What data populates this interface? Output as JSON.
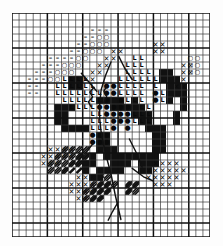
{
  "chart": {
    "type": "grid-pattern",
    "columns": 28,
    "rows": 32,
    "cell_px": 7,
    "heavy_line_every": 5,
    "grid_color": "#3a3a3a",
    "heavy_color": "#111111",
    "fill_color": "#111111",
    "symbol_color": "#0a0a0a",
    "background": "#ffffff"
  },
  "symbols": {
    "L": "L",
    "dot": "●",
    "circle": "○",
    "dash": "–",
    "cross": "✕"
  },
  "legend": {
    "items": [
      {
        "symbol": "L",
        "name": "light-thread"
      },
      {
        "symbol": "●",
        "name": "dot-thread"
      },
      {
        "symbol": "○",
        "name": "circle-thread"
      },
      {
        "symbol": "–",
        "name": "dash-thread"
      },
      {
        "symbol": "✕",
        "name": "cross-thread"
      },
      {
        "symbol": "■",
        "name": "solid-black-thread"
      },
      {
        "symbol": "╱",
        "name": "half-stitch-hatch"
      }
    ]
  },
  "cells": {
    "black": [
      [
        6,
        13
      ],
      [
        6,
        14
      ],
      [
        6,
        15
      ],
      [
        7,
        13
      ],
      [
        7,
        14
      ],
      [
        7,
        15
      ],
      [
        7,
        16
      ],
      [
        8,
        13
      ],
      [
        8,
        16
      ],
      [
        9,
        16
      ],
      [
        10,
        16
      ],
      [
        12,
        12
      ],
      [
        12,
        17
      ],
      [
        12,
        18
      ],
      [
        12,
        19
      ],
      [
        13,
        12
      ],
      [
        13,
        17
      ],
      [
        13,
        18
      ],
      [
        13,
        19
      ],
      [
        13,
        20
      ],
      [
        14,
        12
      ],
      [
        14,
        13
      ],
      [
        14,
        19
      ],
      [
        14,
        20
      ],
      [
        15,
        12
      ],
      [
        15,
        13
      ],
      [
        15,
        20
      ],
      [
        16,
        13
      ],
      [
        16,
        20
      ],
      [
        11,
        20
      ],
      [
        11,
        21
      ],
      [
        10,
        21
      ],
      [
        10,
        22
      ],
      [
        17,
        12
      ],
      [
        17,
        13
      ],
      [
        17,
        14
      ],
      [
        17,
        20
      ],
      [
        18,
        13
      ],
      [
        18,
        14
      ],
      [
        18,
        15
      ],
      [
        18,
        20
      ],
      [
        19,
        14
      ],
      [
        19,
        15
      ],
      [
        19,
        16
      ],
      [
        19,
        20
      ],
      [
        19,
        21
      ],
      [
        20,
        16
      ],
      [
        20,
        17
      ],
      [
        20,
        18
      ],
      [
        20,
        19
      ],
      [
        20,
        20
      ],
      [
        20,
        21
      ],
      [
        21,
        16
      ],
      [
        21,
        17
      ],
      [
        21,
        18
      ],
      [
        21,
        19
      ],
      [
        22,
        10
      ],
      [
        22,
        11
      ],
      [
        22,
        12
      ],
      [
        9,
        9
      ],
      [
        9,
        10
      ],
      [
        8,
        9
      ],
      [
        8,
        10
      ],
      [
        21,
        8
      ],
      [
        21,
        9
      ],
      [
        22,
        8
      ],
      [
        22,
        9
      ],
      [
        23,
        9
      ],
      [
        23,
        10
      ],
      [
        23,
        11
      ],
      [
        24,
        10
      ],
      [
        24,
        11
      ],
      [
        14,
        21
      ],
      [
        14,
        22
      ],
      [
        15,
        21
      ],
      [
        15,
        22
      ],
      [
        16,
        21
      ],
      [
        13,
        22
      ],
      [
        12,
        22
      ],
      [
        12,
        23
      ],
      [
        11,
        23
      ],
      [
        18,
        21
      ],
      [
        18,
        22
      ],
      [
        19,
        22
      ],
      [
        23,
        14
      ],
      [
        23,
        15
      ],
      [
        24,
        12
      ],
      [
        24,
        13
      ]
    ],
    "L": [
      [
        7,
        9
      ],
      [
        8,
        9
      ],
      [
        9,
        9
      ],
      [
        10,
        9
      ],
      [
        6,
        10
      ],
      [
        7,
        10
      ],
      [
        8,
        10
      ],
      [
        9,
        10
      ],
      [
        10,
        10
      ],
      [
        11,
        10
      ],
      [
        6,
        11
      ],
      [
        7,
        11
      ],
      [
        8,
        11
      ],
      [
        9,
        11
      ],
      [
        10,
        11
      ],
      [
        11,
        11
      ],
      [
        12,
        11
      ],
      [
        7,
        12
      ],
      [
        8,
        12
      ],
      [
        9,
        12
      ],
      [
        10,
        12
      ],
      [
        11,
        12
      ],
      [
        12,
        12
      ],
      [
        8,
        13
      ],
      [
        9,
        13
      ],
      [
        10,
        13
      ],
      [
        11,
        13
      ],
      [
        11,
        14
      ],
      [
        12,
        14
      ],
      [
        13,
        14
      ],
      [
        11,
        15
      ],
      [
        12,
        15
      ],
      [
        13,
        15
      ],
      [
        11,
        16
      ],
      [
        12,
        16
      ],
      [
        13,
        16
      ],
      [
        17,
        6
      ],
      [
        18,
        6
      ],
      [
        16,
        7
      ],
      [
        17,
        7
      ],
      [
        18,
        7
      ],
      [
        16,
        8
      ],
      [
        17,
        8
      ],
      [
        18,
        8
      ],
      [
        19,
        8
      ],
      [
        15,
        9
      ],
      [
        16,
        9
      ],
      [
        17,
        9
      ],
      [
        18,
        9
      ],
      [
        19,
        9
      ],
      [
        15,
        10
      ],
      [
        16,
        10
      ],
      [
        17,
        10
      ],
      [
        18,
        10
      ],
      [
        15,
        11
      ],
      [
        16,
        11
      ],
      [
        17,
        11
      ],
      [
        18,
        11
      ],
      [
        16,
        12
      ],
      [
        17,
        12
      ],
      [
        18,
        12
      ],
      [
        18,
        13
      ],
      [
        19,
        13
      ],
      [
        17,
        14
      ],
      [
        18,
        14
      ],
      [
        19,
        14
      ],
      [
        17,
        15
      ],
      [
        18,
        15
      ],
      [
        19,
        15
      ],
      [
        20,
        9
      ],
      [
        20,
        10
      ],
      [
        21,
        11
      ],
      [
        21,
        12
      ]
    ],
    "dot": [
      [
        13,
        10
      ],
      [
        13,
        11
      ],
      [
        13,
        12
      ],
      [
        13,
        13
      ],
      [
        12,
        13
      ],
      [
        11,
        17
      ],
      [
        12,
        17
      ],
      [
        13,
        17
      ],
      [
        11,
        18
      ],
      [
        12,
        18
      ],
      [
        13,
        18
      ],
      [
        14,
        10
      ],
      [
        14,
        11
      ],
      [
        15,
        12
      ],
      [
        15,
        13
      ],
      [
        14,
        13
      ],
      [
        14,
        14
      ],
      [
        13,
        14
      ],
      [
        16,
        13
      ],
      [
        16,
        14
      ],
      [
        15,
        14
      ],
      [
        15,
        15
      ],
      [
        16,
        15
      ],
      [
        16,
        16
      ],
      [
        14,
        15
      ],
      [
        14,
        16
      ],
      [
        20,
        11
      ],
      [
        20,
        12
      ]
    ],
    "circle": [
      [
        12,
        3
      ],
      [
        13,
        3
      ],
      [
        11,
        4
      ],
      [
        12,
        4
      ],
      [
        13,
        4
      ],
      [
        10,
        5
      ],
      [
        11,
        5
      ],
      [
        12,
        5
      ],
      [
        9,
        6
      ],
      [
        10,
        6
      ],
      [
        7,
        7
      ],
      [
        8,
        7
      ],
      [
        9,
        7
      ],
      [
        6,
        8
      ],
      [
        7,
        8
      ],
      [
        8,
        8
      ],
      [
        5,
        9
      ],
      [
        6,
        9
      ],
      [
        25,
        6
      ],
      [
        26,
        6
      ],
      [
        25,
        7
      ],
      [
        26,
        7
      ],
      [
        25,
        8
      ],
      [
        26,
        8
      ]
    ],
    "dash": [
      [
        11,
        2
      ],
      [
        12,
        2
      ],
      [
        13,
        2
      ],
      [
        10,
        3
      ],
      [
        11,
        3
      ],
      [
        9,
        4
      ],
      [
        10,
        4
      ],
      [
        8,
        5
      ],
      [
        9,
        5
      ],
      [
        5,
        6
      ],
      [
        6,
        6
      ],
      [
        7,
        6
      ],
      [
        8,
        6
      ],
      [
        4,
        7
      ],
      [
        5,
        7
      ],
      [
        6,
        7
      ],
      [
        3,
        8
      ],
      [
        4,
        8
      ],
      [
        5,
        8
      ],
      [
        2,
        9
      ],
      [
        3,
        9
      ],
      [
        4,
        9
      ],
      [
        2,
        10
      ],
      [
        3,
        10
      ],
      [
        2,
        11
      ],
      [
        3,
        11
      ]
    ],
    "cross": [
      [
        14,
        5
      ],
      [
        15,
        5
      ],
      [
        13,
        6
      ],
      [
        14,
        6
      ],
      [
        12,
        7
      ],
      [
        13,
        7
      ],
      [
        11,
        8
      ],
      [
        12,
        8
      ],
      [
        10,
        9
      ],
      [
        11,
        9
      ],
      [
        20,
        4
      ],
      [
        21,
        4
      ],
      [
        20,
        5
      ],
      [
        21,
        5
      ],
      [
        24,
        7
      ],
      [
        25,
        7
      ],
      [
        24,
        8
      ],
      [
        25,
        8
      ],
      [
        24,
        9
      ],
      [
        23,
        10
      ],
      [
        24,
        10
      ],
      [
        5,
        19
      ],
      [
        6,
        19
      ],
      [
        7,
        19
      ],
      [
        8,
        19
      ],
      [
        4,
        20
      ],
      [
        5,
        20
      ],
      [
        6,
        20
      ],
      [
        7,
        20
      ],
      [
        8,
        20
      ],
      [
        4,
        21
      ],
      [
        5,
        21
      ],
      [
        6,
        21
      ],
      [
        9,
        23
      ],
      [
        10,
        23
      ],
      [
        11,
        23
      ],
      [
        8,
        24
      ],
      [
        9,
        24
      ],
      [
        10,
        24
      ],
      [
        11,
        24
      ],
      [
        12,
        24
      ],
      [
        8,
        25
      ],
      [
        9,
        25
      ],
      [
        10,
        25
      ],
      [
        11,
        25
      ],
      [
        9,
        26
      ],
      [
        10,
        26
      ],
      [
        20,
        21
      ],
      [
        21,
        21
      ],
      [
        22,
        21
      ],
      [
        23,
        21
      ],
      [
        19,
        22
      ],
      [
        20,
        22
      ],
      [
        21,
        22
      ],
      [
        22,
        22
      ],
      [
        23,
        22
      ],
      [
        24,
        22
      ],
      [
        19,
        23
      ],
      [
        20,
        23
      ],
      [
        21,
        23
      ],
      [
        22,
        23
      ],
      [
        23,
        23
      ],
      [
        20,
        24
      ],
      [
        21,
        24
      ],
      [
        22,
        24
      ]
    ],
    "hatch": [
      [
        7,
        19
      ],
      [
        8,
        19
      ],
      [
        9,
        19
      ],
      [
        10,
        19
      ],
      [
        6,
        20
      ],
      [
        7,
        20
      ],
      [
        8,
        20
      ],
      [
        9,
        20
      ],
      [
        10,
        20
      ],
      [
        5,
        21
      ],
      [
        6,
        21
      ],
      [
        7,
        21
      ],
      [
        8,
        21
      ],
      [
        9,
        21
      ],
      [
        5,
        22
      ],
      [
        6,
        22
      ],
      [
        7,
        22
      ],
      [
        11,
        23
      ],
      [
        12,
        23
      ],
      [
        13,
        23
      ],
      [
        11,
        24
      ],
      [
        12,
        24
      ],
      [
        13,
        24
      ],
      [
        14,
        24
      ],
      [
        10,
        25
      ],
      [
        11,
        25
      ],
      [
        12,
        25
      ],
      [
        13,
        25
      ],
      [
        10,
        26
      ],
      [
        11,
        26
      ],
      [
        12,
        26
      ],
      [
        16,
        24
      ],
      [
        17,
        24
      ],
      [
        16,
        25
      ],
      [
        17,
        25
      ]
    ]
  },
  "backstitch": [
    {
      "name": "stem-main",
      "points": [
        [
          14.0,
          7.0
        ],
        [
          13.2,
          9.0
        ],
        [
          12.6,
          11.0
        ],
        [
          12.4,
          13.0
        ],
        [
          12.4,
          15.0
        ],
        [
          12.6,
          17.0
        ],
        [
          13.2,
          20.0
        ],
        [
          14.0,
          23.0
        ],
        [
          14.6,
          26.0
        ],
        [
          15.4,
          29.5
        ]
      ]
    },
    {
      "name": "stem-upper-right",
      "points": [
        [
          15.1,
          6.2
        ],
        [
          16.0,
          8.0
        ],
        [
          17.0,
          9.5
        ]
      ]
    },
    {
      "name": "stem-upper-left",
      "points": [
        [
          9.8,
          8.6
        ],
        [
          11.0,
          10.0
        ],
        [
          12.0,
          11.2
        ]
      ]
    },
    {
      "name": "stem-zigzag-left",
      "points": [
        [
          11.6,
          10.6
        ],
        [
          11.0,
          11.3
        ],
        [
          11.4,
          12.0
        ],
        [
          10.8,
          12.7
        ],
        [
          11.2,
          13.4
        ]
      ]
    },
    {
      "name": "stem-zigzag-right",
      "points": [
        [
          13.4,
          10.4
        ],
        [
          13.0,
          11.2
        ],
        [
          13.4,
          12.0
        ],
        [
          13.0,
          12.8
        ]
      ]
    },
    {
      "name": "stem-lower-left",
      "points": [
        [
          11.6,
          18.5
        ],
        [
          10.2,
          20.2
        ],
        [
          9.0,
          21.6
        ]
      ]
    },
    {
      "name": "stem-lower-right",
      "points": [
        [
          16.6,
          18.0
        ],
        [
          17.6,
          20.0
        ],
        [
          18.4,
          22.0
        ]
      ]
    },
    {
      "name": "stem-branch-right",
      "points": [
        [
          17.0,
          22.2
        ],
        [
          18.6,
          23.4
        ],
        [
          20.0,
          24.0
        ]
      ]
    },
    {
      "name": "stem-tip-bottom",
      "points": [
        [
          15.0,
          27.0
        ],
        [
          14.2,
          28.4
        ],
        [
          13.6,
          29.6
        ]
      ]
    }
  ],
  "hatch_dashes": [
    {
      "name": "dash-cluster-left",
      "cells": [
        [
          9,
          20
        ],
        [
          10,
          20
        ],
        [
          8,
          21
        ],
        [
          9,
          21
        ],
        [
          10,
          21
        ],
        [
          7,
          22
        ],
        [
          8,
          22
        ],
        [
          9,
          22
        ]
      ]
    },
    {
      "name": "dash-cluster-mid",
      "cells": [
        [
          12,
          24
        ],
        [
          13,
          24
        ],
        [
          11,
          25
        ],
        [
          12,
          25
        ],
        [
          13,
          25
        ],
        [
          11,
          26
        ],
        [
          12,
          26
        ]
      ]
    },
    {
      "name": "dash-cluster-right",
      "cells": [
        [
          16,
          24
        ],
        [
          17,
          24
        ],
        [
          16,
          25
        ]
      ]
    }
  ]
}
